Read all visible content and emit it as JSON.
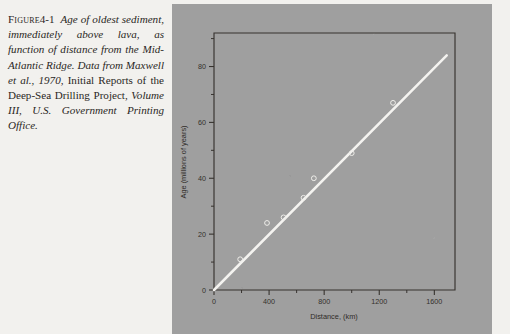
{
  "figure": {
    "label": "Figure",
    "number": "4-1",
    "caption_part1": "Age of oldest sediment, immediately above lava, as function of distance from the Mid-Atlantic Ridge. Data from Maxwell et al., 1970,",
    "caption_part2": "Initial Reports of the Deep-Sea Drilling Project,",
    "caption_part3": "Volume III, U.S. Government Printing Office.",
    "full_caption": "Figure 4-1  Age of oldest sediment, immediately above lava, as function of distance from the Mid-Atlantic Ridge. Data from Maxwell et al., 1970, Initial Reports of the Deep-Sea Drilling Project, Volume III, U.S. Government Printing Office."
  },
  "colors": {
    "page_background": "#f2f1ee",
    "plate_background": "#9f9f9f",
    "axis": "#37332f",
    "trend_line": "#f4f3f0",
    "marker": "#efeeea",
    "caption_text": "#2a2724"
  },
  "chart_data": {
    "type": "scatter",
    "title": "",
    "xlabel": "Distance, (km)",
    "ylabel": "Age (millions of years)",
    "xlim": [
      0,
      1750
    ],
    "ylim": [
      0,
      92
    ],
    "xticks": [
      0,
      400,
      800,
      1200,
      1600
    ],
    "xtick_labels": [
      "0",
      "400",
      "800",
      "1200",
      "1600"
    ],
    "xminor_ticks": [
      200,
      600,
      1000,
      1400
    ],
    "yticks": [
      0,
      20,
      40,
      60,
      80
    ],
    "ytick_labels": [
      "0",
      "20",
      "40",
      "60",
      "80"
    ],
    "yminor_ticks": [
      10,
      30,
      50,
      70,
      90
    ],
    "grid": false,
    "legend": null,
    "series": [
      {
        "name": "Oldest sediment age vs distance",
        "marker": "open-circle",
        "points": [
          {
            "x": 190,
            "y": 11
          },
          {
            "x": 385,
            "y": 24
          },
          {
            "x": 505,
            "y": 26
          },
          {
            "x": 650,
            "y": 33
          },
          {
            "x": 725,
            "y": 40
          },
          {
            "x": 1000,
            "y": 49
          },
          {
            "x": 1300,
            "y": 67
          }
        ]
      }
    ],
    "trend_line": {
      "name": "spreading-rate fit",
      "x_start": 0,
      "y_start": 0,
      "x_end": 1690,
      "y_end": 84
    }
  }
}
